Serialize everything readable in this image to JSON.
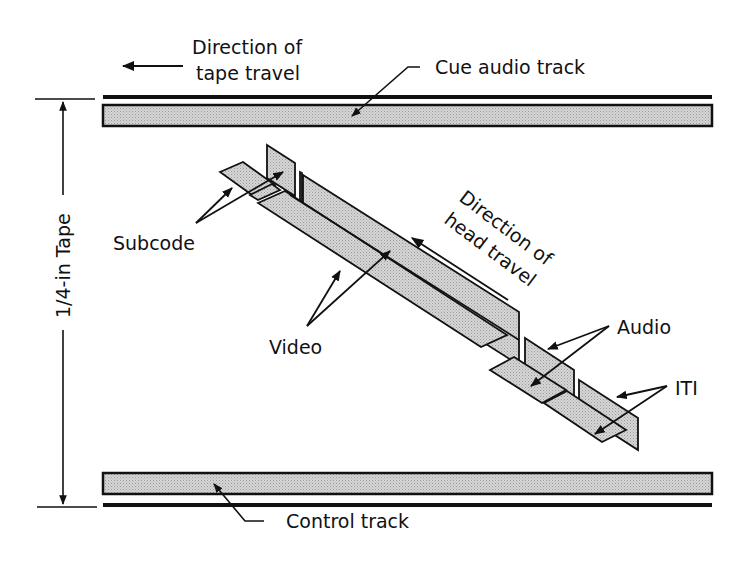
{
  "diagram": {
    "labels": {
      "tape_direction_line1": "Direction of",
      "tape_direction_line2": "tape travel",
      "cue_audio_track": "Cue audio track",
      "tape_width": "1/4-in Tape",
      "subcode": "Subcode",
      "video": "Video",
      "head_direction_line1": "Direction of",
      "head_direction_line2": "head travel",
      "audio": "Audio",
      "iti": "ITI",
      "control_track": "Control track"
    },
    "components": [
      {
        "id": "cue-audio-track",
        "label": "Cue audio track",
        "type": "longitudinal track",
        "position": "top edge"
      },
      {
        "id": "control-track",
        "label": "Control track",
        "type": "longitudinal track",
        "position": "bottom edge"
      },
      {
        "id": "subcode",
        "label": "Subcode",
        "type": "helical segment",
        "count": 2
      },
      {
        "id": "video",
        "label": "Video",
        "type": "helical segment",
        "count": 2
      },
      {
        "id": "audio",
        "label": "Audio",
        "type": "helical segment",
        "count": 2
      },
      {
        "id": "iti",
        "label": "ITI",
        "type": "helical segment",
        "count": 2
      }
    ],
    "arrows": [
      {
        "label": "Direction of tape travel",
        "direction": "left"
      },
      {
        "label": "Direction of head travel",
        "direction": "up-left along tracks"
      },
      {
        "label": "1/4-in Tape",
        "direction": "vertical double-headed"
      }
    ],
    "colors": {
      "ink": "#111111",
      "fill": "#c8c8c8",
      "background": "#ffffff"
    }
  }
}
